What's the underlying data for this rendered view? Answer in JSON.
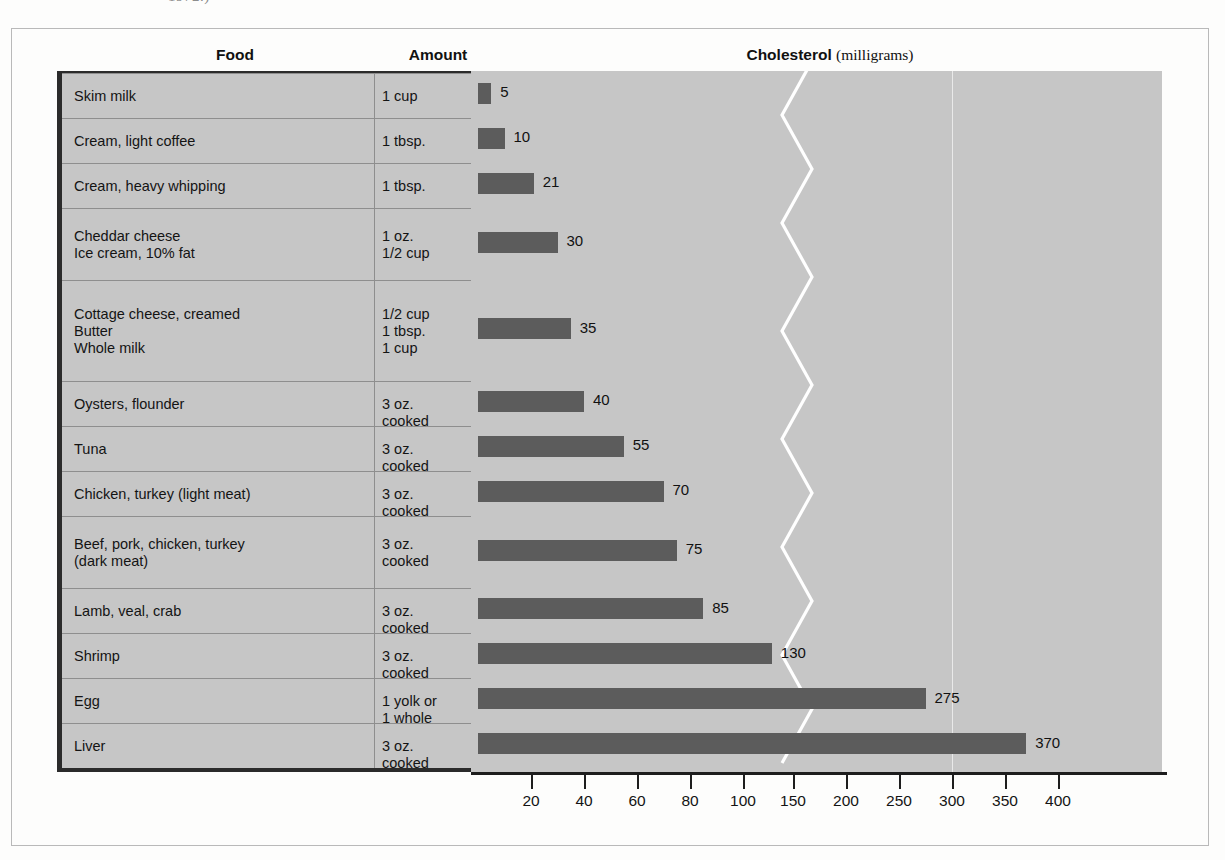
{
  "caption_tail": "1972.)",
  "headers": {
    "food": "Food",
    "amount": "Amount",
    "cholesterol": "Cholesterol",
    "cholesterol_unit": "(milligrams)"
  },
  "chart_data": {
    "type": "bar",
    "title": "Cholesterol (milligrams)",
    "xlabel": "Cholesterol (milligrams)",
    "ylabel": "Food",
    "orientation": "horizontal",
    "grid": false,
    "legend": null,
    "axis_ticks": [
      20,
      40,
      60,
      80,
      100,
      150,
      200,
      250,
      300,
      350,
      400
    ],
    "axis_note": "Scale is compressed above 100 mg: 20-100 ticks are spaced per 20 mg, 150-400 ticks per 50 mg.",
    "xlim": [
      0,
      410
    ],
    "categories": [
      "Skim milk",
      "Cream, light coffee",
      "Cream, heavy whipping",
      "Cheddar cheese / Ice cream, 10% fat",
      "Cottage cheese, creamed / Butter / Whole milk",
      "Oysters, flounder",
      "Tuna",
      "Chicken, turkey (light meat)",
      "Beef, pork, chicken, turkey (dark meat)",
      "Lamb, veal, crab",
      "Shrimp",
      "Egg",
      "Liver"
    ],
    "values": [
      5,
      10,
      21,
      30,
      35,
      40,
      55,
      70,
      75,
      85,
      130,
      275,
      370
    ]
  },
  "rows": [
    {
      "food": "Skim milk",
      "amount": "1 cup",
      "value": 5,
      "label": "5"
    },
    {
      "food": "Cream, light coffee",
      "amount": "1 tbsp.",
      "value": 10,
      "label": "10"
    },
    {
      "food": "Cream, heavy whipping",
      "amount": "1 tbsp.",
      "value": 21,
      "label": "21"
    },
    {
      "food": "Cheddar cheese\nIce cream, 10% fat",
      "amount": "1 oz.\n1/2 cup",
      "value": 30,
      "label": "30"
    },
    {
      "food": "Cottage cheese, creamed\nButter\nWhole milk",
      "amount": "1/2 cup\n1 tbsp.\n1 cup",
      "value": 35,
      "label": "35"
    },
    {
      "food": "Oysters, flounder",
      "amount": "3 oz.\ncooked",
      "value": 40,
      "label": "40"
    },
    {
      "food": "Tuna",
      "amount": "3 oz.\ncooked",
      "value": 55,
      "label": "55"
    },
    {
      "food": "Chicken, turkey (light meat)",
      "amount": "3 oz.\ncooked",
      "value": 70,
      "label": "70"
    },
    {
      "food": "Beef, pork, chicken, turkey\n(dark meat)",
      "amount": "3 oz.\ncooked",
      "value": 75,
      "label": "75"
    },
    {
      "food": "Lamb, veal, crab",
      "amount": "3 oz.\ncooked",
      "value": 85,
      "label": "85"
    },
    {
      "food": "Shrimp",
      "amount": "3 oz.\ncooked",
      "value": 130,
      "label": "130"
    },
    {
      "food": "Egg",
      "amount": "1 yolk or\n1 whole",
      "value": 275,
      "label": "275"
    },
    {
      "food": "Liver",
      "amount": "3 oz.\ncooked",
      "value": 370,
      "label": "370"
    }
  ],
  "colors": {
    "bar": "#5c5c5c",
    "panel": "#c6c6c6",
    "rule": "#8e8e8e",
    "frame": "#2b2b2b",
    "accent_line": "#ffffff"
  }
}
